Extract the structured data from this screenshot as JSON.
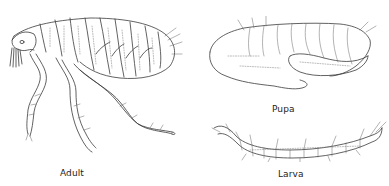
{
  "figure": {
    "panels": [
      {
        "id": "adult",
        "label": "Adult"
      },
      {
        "id": "pupa",
        "label": "Pupa"
      },
      {
        "id": "larva",
        "label": "Larva"
      }
    ]
  },
  "colors": {
    "line": "#3a3a3a",
    "background": "#ffffff",
    "text": "#222222"
  }
}
